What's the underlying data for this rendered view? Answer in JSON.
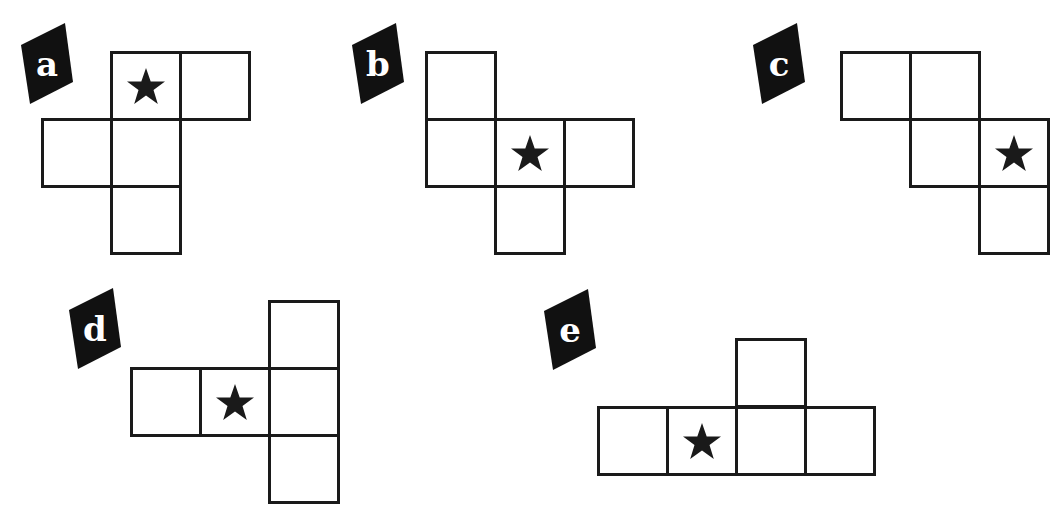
{
  "colors": {
    "stroke": "#1a1a1a",
    "label_bg": "#111111",
    "label_text": "#ffffff",
    "star": "#1a1a1a",
    "background": "#ffffff"
  },
  "cell_size": {
    "w": 69,
    "h": 67
  },
  "nets": [
    {
      "label": "a",
      "label_pos": {
        "x": 19,
        "y": 22
      },
      "cells": [
        {
          "x": 110,
          "y": 51,
          "star": true
        },
        {
          "x": 179,
          "y": 51,
          "star": false
        },
        {
          "x": 41,
          "y": 118,
          "star": false
        },
        {
          "x": 110,
          "y": 118,
          "star": false
        },
        {
          "x": 110,
          "y": 185,
          "star": false
        }
      ]
    },
    {
      "label": "b",
      "label_pos": {
        "x": 350,
        "y": 22
      },
      "cells": [
        {
          "x": 425,
          "y": 51,
          "star": false
        },
        {
          "x": 425,
          "y": 118,
          "star": false
        },
        {
          "x": 494,
          "y": 118,
          "star": true
        },
        {
          "x": 563,
          "y": 118,
          "star": false
        },
        {
          "x": 494,
          "y": 185,
          "star": false
        }
      ]
    },
    {
      "label": "c",
      "label_pos": {
        "x": 751,
        "y": 22
      },
      "cells": [
        {
          "x": 840,
          "y": 51,
          "star": false
        },
        {
          "x": 909,
          "y": 51,
          "star": false
        },
        {
          "x": 909,
          "y": 118,
          "star": false
        },
        {
          "x": 978,
          "y": 118,
          "star": true
        },
        {
          "x": 978,
          "y": 185,
          "star": false
        }
      ]
    },
    {
      "label": "d",
      "label_pos": {
        "x": 67,
        "y": 287
      },
      "cells": [
        {
          "x": 268,
          "y": 300,
          "star": false
        },
        {
          "x": 130,
          "y": 367,
          "star": false
        },
        {
          "x": 199,
          "y": 367,
          "star": true
        },
        {
          "x": 268,
          "y": 367,
          "star": false
        },
        {
          "x": 268,
          "y": 434,
          "star": false
        }
      ]
    },
    {
      "label": "e",
      "label_pos": {
        "x": 542,
        "y": 288
      },
      "cells": [
        {
          "x": 735,
          "y": 338,
          "star": false
        },
        {
          "x": 597,
          "y": 406,
          "star": false
        },
        {
          "x": 666,
          "y": 406,
          "star": true
        },
        {
          "x": 735,
          "y": 406,
          "star": false
        },
        {
          "x": 804,
          "y": 406,
          "star": false
        }
      ]
    }
  ],
  "icons": {
    "star": "star-icon",
    "label_badge": "tilted-label-badge"
  }
}
